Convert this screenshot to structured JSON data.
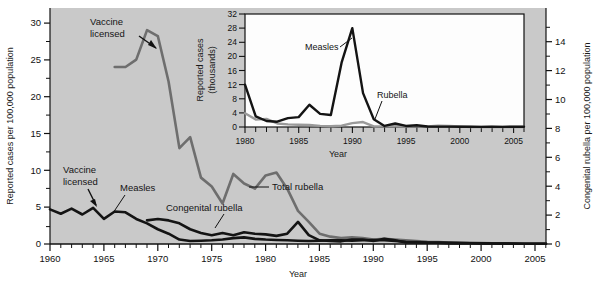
{
  "figure": {
    "background_plot": "#c9c9c9",
    "inset_background": "#fdfdfd",
    "series_colors": {
      "total_rubella": "#6e6e6e",
      "measles_dark": "#141414",
      "congenital_rubella": "#141414",
      "rubella_inset": "#9a9a9a"
    }
  },
  "main_axes": {
    "left_axis_label": "Reported cases per 100,000 population",
    "right_axis_label": "Congenital rubella per 100,000 population",
    "x_axis_label": "Year",
    "left_ticks": [
      "0",
      "5",
      "10",
      "15",
      "20",
      "25",
      "30"
    ],
    "right_ticks": [
      "0",
      "2",
      "4",
      "6",
      "8",
      "10",
      "12",
      "14"
    ],
    "x_ticks": [
      "1960",
      "1965",
      "1970",
      "1975",
      "1980",
      "1985",
      "1990",
      "1995",
      "2000",
      "2005"
    ]
  },
  "main_annotations": {
    "vaccine_licensed_top": "Vaccine\nlicensed",
    "vaccine_licensed_top_line1": "Vaccine",
    "vaccine_licensed_top_line2": "licensed",
    "vaccine_licensed_bottom_line1": "Vaccine",
    "vaccine_licensed_bottom_line2": "licensed",
    "measles_label": "Measles",
    "congenital_rubella_label": "Congenital rubella",
    "total_rubella_label": "Total rubella"
  },
  "inset_axes": {
    "y_axis_label_line1": "Reported cases",
    "y_axis_label_line2": "(thousands)",
    "x_axis_label": "Year",
    "y_ticks": [
      "0",
      "4",
      "8",
      "12",
      "16",
      "20",
      "24",
      "28",
      "32"
    ],
    "x_ticks": [
      "1980",
      "1985",
      "1990",
      "1995",
      "2000",
      "2005"
    ]
  },
  "inset_annotations": {
    "measles_label": "Measles",
    "rubella_label": "Rubella"
  },
  "chart_data": [
    {
      "type": "line",
      "id": "main-chart",
      "title": "",
      "xlabel": "Year",
      "ylabel": "Reported cases per 100,000 population",
      "y2label": "Congenital rubella per 100,000 population",
      "xlim": [
        1960,
        2006
      ],
      "ylim": [
        0,
        32
      ],
      "y2lim": [
        0,
        16
      ],
      "grid": false,
      "legend": "inline-annotations",
      "series": [
        {
          "name": "Total rubella",
          "color": "#6e6e6e",
          "axis": "left",
          "x": [
            1966,
            1967,
            1968,
            1969,
            1970,
            1971,
            1972,
            1973,
            1974,
            1975,
            1976,
            1977,
            1978,
            1979,
            1980,
            1981,
            1982,
            1983,
            1984,
            1985,
            1986,
            1987,
            1988,
            1989,
            1990,
            1991,
            1992,
            1993,
            1994,
            1995,
            1996,
            1997,
            1998,
            1999,
            2000,
            2001,
            2002,
            2003,
            2004,
            2005,
            2006
          ],
          "values": [
            24.0,
            24.0,
            25.0,
            29.0,
            28.2,
            22.0,
            13.0,
            14.5,
            9.0,
            7.8,
            5.5,
            9.5,
            8.2,
            7.5,
            9.3,
            9.7,
            7.5,
            4.5,
            3.0,
            1.4,
            1.0,
            0.8,
            0.9,
            0.8,
            0.6,
            0.7,
            0.6,
            0.5,
            0.4,
            0.3,
            0.25,
            0.2,
            0.2,
            0.15,
            0.12,
            0.1,
            0.08,
            0.05,
            0.04,
            0.03,
            0.03
          ]
        },
        {
          "name": "Measles",
          "color": "#141414",
          "axis": "left",
          "x": [
            1960,
            1961,
            1962,
            1963,
            1964,
            1965,
            1966,
            1967,
            1968,
            1969,
            1970,
            1971,
            1972,
            1973,
            1974,
            1975,
            1976,
            1977,
            1978,
            1979,
            1980,
            1981,
            1982,
            1983,
            1984,
            1985,
            1986,
            1987,
            1988,
            1989,
            1990,
            1991,
            1992,
            1993,
            1994,
            1995,
            1996,
            1997,
            1998,
            1999,
            2000,
            2001,
            2002,
            2003,
            2004,
            2005,
            2006
          ],
          "values": [
            4.7,
            4.1,
            4.8,
            4.0,
            4.9,
            3.4,
            4.4,
            4.3,
            3.4,
            2.8,
            2.0,
            1.4,
            0.6,
            0.4,
            0.45,
            0.5,
            0.6,
            0.8,
            0.9,
            0.7,
            0.6,
            0.55,
            0.5,
            0.45,
            0.4,
            0.45,
            0.5,
            0.5,
            0.45,
            0.5,
            0.55,
            0.5,
            0.4,
            0.3,
            0.25,
            0.2,
            0.18,
            0.15,
            0.12,
            0.1,
            0.08,
            0.06,
            0.05,
            0.05,
            0.04,
            0.03,
            0.03
          ]
        },
        {
          "name": "Congenital rubella",
          "color": "#141414",
          "axis": "right",
          "x": [
            1969,
            1970,
            1971,
            1972,
            1973,
            1974,
            1975,
            1976,
            1977,
            1978,
            1979,
            1980,
            1981,
            1982,
            1983,
            1984,
            1985,
            1986,
            1987,
            1988,
            1989,
            1990,
            1991,
            1992,
            1993,
            1994,
            1995,
            1996,
            1997,
            1998,
            1999,
            2000,
            2001,
            2002,
            2003,
            2004,
            2005,
            2006
          ],
          "values": [
            1.6,
            1.7,
            1.6,
            1.4,
            1.0,
            0.75,
            0.6,
            0.75,
            0.6,
            0.8,
            0.7,
            0.65,
            0.55,
            0.7,
            1.5,
            0.6,
            0.25,
            0.2,
            0.18,
            0.3,
            0.3,
            0.2,
            0.35,
            0.25,
            0.1,
            0.1,
            0.08,
            0.08,
            0.06,
            0.05,
            0.05,
            0.04,
            0.03,
            0.03,
            0.02,
            0.02,
            0.02,
            0.02
          ]
        }
      ]
    },
    {
      "type": "line",
      "id": "inset-chart",
      "title": "",
      "xlabel": "Year",
      "ylabel": "Reported cases (thousands)",
      "xlim": [
        1980,
        2006
      ],
      "ylim": [
        0,
        32
      ],
      "grid": false,
      "legend": "inline-annotations",
      "series": [
        {
          "name": "Measles",
          "color": "#141414",
          "x": [
            1980,
            1981,
            1982,
            1983,
            1984,
            1985,
            1986,
            1987,
            1988,
            1989,
            1990,
            1991,
            1992,
            1993,
            1994,
            1995,
            1996,
            1997,
            1998,
            1999,
            2000,
            2001,
            2002,
            2003,
            2004,
            2005,
            2006
          ],
          "values": [
            12.0,
            3.0,
            1.7,
            1.5,
            2.5,
            2.8,
            6.3,
            3.7,
            3.4,
            18.2,
            28.0,
            9.6,
            2.2,
            0.3,
            1.0,
            0.3,
            0.5,
            0.14,
            0.1,
            0.1,
            0.09,
            0.12,
            0.04,
            0.06,
            0.04,
            0.07,
            0.05
          ]
        },
        {
          "name": "Rubella",
          "color": "#9a9a9a",
          "x": [
            1980,
            1981,
            1982,
            1983,
            1984,
            1985,
            1986,
            1987,
            1988,
            1989,
            1990,
            1991,
            1992,
            1993,
            1994,
            1995,
            1996,
            1997,
            1998,
            1999,
            2000,
            2001,
            2002,
            2003,
            2004,
            2005,
            2006
          ],
          "values": [
            3.9,
            2.1,
            2.3,
            1.0,
            0.75,
            0.63,
            0.55,
            0.31,
            0.23,
            0.4,
            1.1,
            1.4,
            0.16,
            0.19,
            0.23,
            0.13,
            0.24,
            0.18,
            0.36,
            0.27,
            0.18,
            0.02,
            0.02,
            0.01,
            0.01,
            0.01,
            0.01
          ]
        }
      ]
    }
  ]
}
